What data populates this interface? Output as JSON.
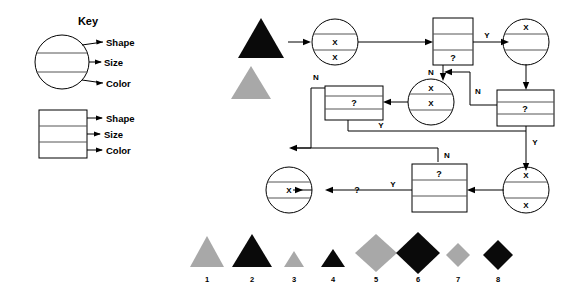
{
  "key_panel": {
    "title": "Key",
    "circle_labels": [
      "Shape",
      "Size",
      "Color"
    ],
    "rect_labels": [
      "Shape",
      "Size",
      "Color"
    ]
  },
  "flowchart": {
    "nodes": [
      {
        "id": "n1",
        "shape": "triangle",
        "color": "black",
        "size": "large",
        "cells": []
      },
      {
        "id": "n2",
        "shape": "triangle",
        "color": "gray",
        "size": "large",
        "cells": []
      },
      {
        "id": "n3",
        "shape": "circle",
        "cells": [
          "",
          "X",
          "X"
        ]
      },
      {
        "id": "n4",
        "shape": "rect",
        "cells": [
          "",
          "",
          "?"
        ]
      },
      {
        "id": "n5",
        "shape": "circle",
        "cells": [
          "X",
          "",
          ""
        ]
      },
      {
        "id": "n6",
        "shape": "rect",
        "cells": [
          "",
          "?",
          ""
        ]
      },
      {
        "id": "n7",
        "shape": "circle",
        "cells": [
          "X",
          "X",
          ""
        ]
      },
      {
        "id": "n8",
        "shape": "rect",
        "cells": [
          "",
          "?",
          ""
        ]
      },
      {
        "id": "n9",
        "shape": "circle",
        "cells": [
          "",
          "X",
          ""
        ]
      },
      {
        "id": "n10",
        "shape": "rect",
        "cells": [
          "?",
          "",
          ""
        ]
      },
      {
        "id": "n11",
        "shape": "circle",
        "cells": [
          "X",
          "",
          "X"
        ]
      }
    ],
    "edge_labels": {
      "e_top_y": "Y",
      "e_n_left_of_n4": "N",
      "e_n_right_mid": "N",
      "e_n_to_n6": "N",
      "e_y_from_n6": "Y",
      "e_y_right_down": "Y",
      "e_n_to_n10": "N",
      "e_y_to_output": "Y"
    },
    "output_marker": "?"
  },
  "legend": {
    "items": [
      {
        "number": "1",
        "shape": "triangle",
        "color": "gray",
        "size": "large"
      },
      {
        "number": "2",
        "shape": "triangle",
        "color": "black",
        "size": "large"
      },
      {
        "number": "3",
        "shape": "triangle",
        "color": "gray",
        "size": "small"
      },
      {
        "number": "4",
        "shape": "triangle",
        "color": "black",
        "size": "small"
      },
      {
        "number": "5",
        "shape": "diamond",
        "color": "gray",
        "size": "large"
      },
      {
        "number": "6",
        "shape": "diamond",
        "color": "black",
        "size": "large"
      },
      {
        "number": "7",
        "shape": "diamond",
        "color": "gray",
        "size": "small"
      },
      {
        "number": "8",
        "shape": "diamond",
        "color": "black",
        "size": "small"
      }
    ]
  },
  "colors": {
    "black": "#0a0a0a",
    "gray": "#a8a8a8",
    "stroke": "#000000",
    "divider": "#555555",
    "background": "#ffffff"
  }
}
